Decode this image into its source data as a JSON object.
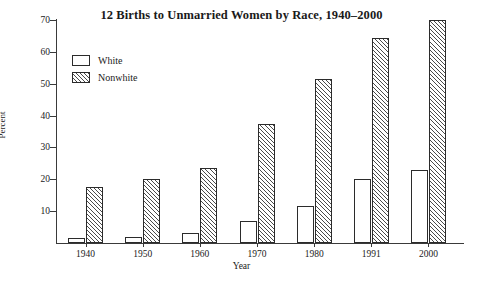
{
  "chart_data": {
    "type": "bar",
    "title": "12  Births to Unmarried Women by Race, 1940–2000",
    "xlabel": "Year",
    "ylabel": "Percent",
    "categories": [
      "1940",
      "1950",
      "1960",
      "1970",
      "1980",
      "1991",
      "2000"
    ],
    "series": [
      {
        "name": "White",
        "values": [
          1.7,
          2.0,
          3.0,
          7.0,
          11.5,
          20.0,
          23.0
        ]
      },
      {
        "name": "Nonwhite",
        "values": [
          17.5,
          20.0,
          23.5,
          37.5,
          51.5,
          64.5,
          70.0
        ]
      }
    ],
    "ylim": [
      0,
      70
    ],
    "yticks": [
      "10",
      "20",
      "30",
      "40",
      "50",
      "60",
      "70"
    ],
    "ytick_values": [
      10,
      20,
      30,
      40,
      50,
      60,
      70
    ],
    "grid": false,
    "legend_position": "top-left",
    "colors": {
      "bar_outline": "#2b2b2b",
      "white_fill": "#ffffff",
      "nonwhite_hatch": "#4a4a4a",
      "axis": "#3a3a3a",
      "text": "#1a1a1a",
      "background": "#ffffff"
    }
  }
}
